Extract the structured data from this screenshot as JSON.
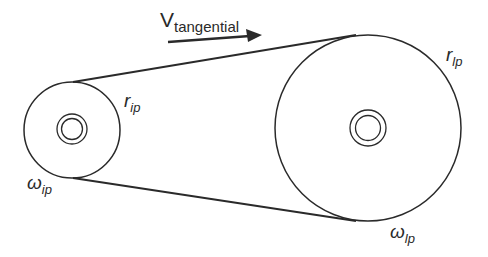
{
  "diagram": {
    "type": "belt-drive",
    "labels": {
      "velocity": {
        "symbol": "V",
        "subscript": "tangential"
      },
      "small_radius": {
        "symbol": "r",
        "subscript": "ip"
      },
      "small_omega": {
        "symbol": "ω",
        "subscript": "ip"
      },
      "large_radius": {
        "symbol": "r",
        "subscript": "lp"
      },
      "large_omega": {
        "symbol": "ω",
        "subscript": "lp"
      }
    },
    "colors": {
      "stroke": "#2a2a2a",
      "background": "#ffffff"
    }
  }
}
